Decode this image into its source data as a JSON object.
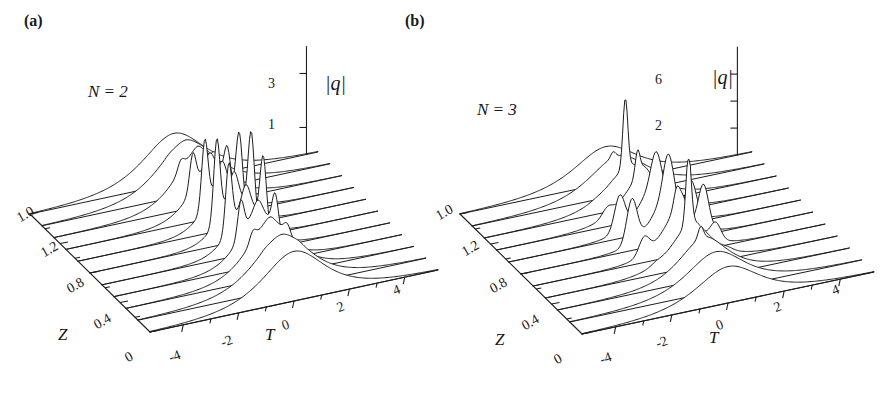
{
  "figure": {
    "background_color": "#ffffff",
    "line_color": "#1d1d1d",
    "panels": [
      {
        "tag": "(a)",
        "condition_label": "N = 2",
        "vertical_axis": {
          "label": "|q|",
          "label_symbol": "q",
          "tick_labels": [
            "3",
            "1"
          ],
          "tick_values": [
            3,
            1
          ],
          "range": [
            0,
            4
          ]
        },
        "t_axis": {
          "label": "T",
          "tick_labels": [
            "-4",
            "-2",
            "0",
            "2",
            "4"
          ]
        },
        "z_axis": {
          "label": "Z",
          "tick_labels": [
            "0",
            "0.4",
            "0.8",
            "1.2",
            "1.0"
          ]
        }
      },
      {
        "tag": "(b)",
        "condition_label": "N = 3",
        "vertical_axis": {
          "label": "|q|",
          "label_symbol": "q",
          "tick_labels": [
            "6",
            "2"
          ],
          "tick_values": [
            6,
            2
          ],
          "range": [
            0,
            8
          ]
        },
        "t_axis": {
          "label": "T",
          "tick_labels": [
            "-4",
            "-2",
            "0",
            "2",
            "4"
          ]
        },
        "z_axis": {
          "label": "Z",
          "tick_labels": [
            "0",
            "0.4",
            "0.8",
            "1.2",
            "1.0"
          ]
        }
      }
    ]
  },
  "chart_data": [
    {
      "type": "line",
      "title": "(a) N = 2 higher-order soliton evolution",
      "plot_style": "3d-waterfall",
      "xlabel": "T",
      "ylabel": "Z",
      "zlabel": "|q|",
      "xlim": [
        -5,
        5
      ],
      "ylim": [
        0,
        1.6
      ],
      "zlim": [
        0,
        4
      ],
      "xticks": [
        -4,
        -2,
        0,
        2,
        4
      ],
      "yticks": [
        0,
        0.4,
        0.8,
        1.2,
        1.6
      ],
      "zticks": [
        1,
        3
      ],
      "grid": false,
      "legend": "none",
      "annotations": [
        "N = 2"
      ],
      "series": [
        {
          "name": "Z = 0.00",
          "z": 0.0,
          "peak_amplitude": 2.0,
          "peak_count": 1,
          "peak_T": [
            0.0
          ],
          "description": "single broad sech pulse"
        },
        {
          "name": "Z = 0.16",
          "z": 0.16,
          "peak_amplitude": 2.1,
          "peak_count": 1,
          "peak_T": [
            0.0
          ],
          "description": "pulse narrowing begins"
        },
        {
          "name": "Z = 0.32",
          "z": 0.32,
          "peak_amplitude": 2.4,
          "peak_count": 1,
          "peak_T": [
            0.0
          ],
          "description": "compressing"
        },
        {
          "name": "Z = 0.48",
          "z": 0.48,
          "peak_amplitude": 2.9,
          "peak_count": 1,
          "peak_T": [
            0.0
          ],
          "description": "strong compression"
        },
        {
          "name": "Z = 0.64",
          "z": 0.64,
          "peak_amplitude": 3.5,
          "peak_count": 2,
          "peak_T": [
            -0.5,
            0.5
          ],
          "description": "splitting into two peaks"
        },
        {
          "name": "Z = 0.80",
          "z": 0.8,
          "peak_amplitude": 3.9,
          "peak_count": 2,
          "peak_T": [
            -0.7,
            0.7
          ],
          "description": "maximum compression, twin spikes"
        },
        {
          "name": "Z = 0.96",
          "z": 0.96,
          "peak_amplitude": 3.6,
          "peak_count": 2,
          "peak_T": [
            -0.6,
            0.6
          ],
          "description": "recombination starts"
        },
        {
          "name": "Z = 1.12",
          "z": 1.12,
          "peak_amplitude": 3.0,
          "peak_count": 1,
          "peak_T": [
            0.0
          ],
          "description": "merging back"
        },
        {
          "name": "Z = 1.28",
          "z": 1.28,
          "peak_amplitude": 2.4,
          "peak_count": 1,
          "peak_T": [
            0.0
          ],
          "description": "broadening"
        },
        {
          "name": "Z = 1.44",
          "z": 1.44,
          "peak_amplitude": 2.1,
          "peak_count": 1,
          "peak_T": [
            0.0
          ],
          "description": "near recurrence"
        },
        {
          "name": "Z = 1.60",
          "z": 1.6,
          "peak_amplitude": 2.0,
          "peak_count": 1,
          "peak_T": [
            0.0
          ],
          "description": "full periodic recurrence"
        }
      ]
    },
    {
      "type": "line",
      "title": "(b) N = 3 higher-order soliton evolution",
      "plot_style": "3d-waterfall",
      "xlabel": "T",
      "ylabel": "Z",
      "zlabel": "|q|",
      "xlim": [
        -5,
        5
      ],
      "ylim": [
        0,
        1.6
      ],
      "zlim": [
        0,
        8
      ],
      "xticks": [
        -4,
        -2,
        0,
        2,
        4
      ],
      "yticks": [
        0,
        0.4,
        0.8,
        1.2,
        1.6
      ],
      "zticks": [
        2,
        4,
        6
      ],
      "grid": false,
      "legend": "none",
      "annotations": [
        "N = 3"
      ],
      "series": [
        {
          "name": "Z = 0.00",
          "z": 0.0,
          "peak_amplitude": 3.0,
          "peak_count": 1,
          "peak_T": [
            0.0
          ],
          "description": "single broad sech pulse"
        },
        {
          "name": "Z = 0.16",
          "z": 0.16,
          "peak_amplitude": 3.4,
          "peak_count": 1,
          "peak_T": [
            0.0
          ],
          "description": "narrowing"
        },
        {
          "name": "Z = 0.32",
          "z": 0.32,
          "peak_amplitude": 4.4,
          "peak_count": 1,
          "peak_T": [
            0.0
          ],
          "description": "sharp compression"
        },
        {
          "name": "Z = 0.48",
          "z": 0.48,
          "peak_amplitude": 6.3,
          "peak_count": 1,
          "peak_T": [
            0.0
          ],
          "description": "very tall narrow spike"
        },
        {
          "name": "Z = 0.64",
          "z": 0.64,
          "peak_amplitude": 5.5,
          "peak_count": 2,
          "peak_T": [
            -0.8,
            0.6
          ],
          "description": "splitting"
        },
        {
          "name": "Z = 0.80",
          "z": 0.8,
          "peak_amplitude": 5.0,
          "peak_count": 3,
          "peak_T": [
            -1.2,
            0.0,
            1.2
          ],
          "description": "three-peak structure"
        },
        {
          "name": "Z = 0.96",
          "z": 0.96,
          "peak_amplitude": 4.6,
          "peak_count": 3,
          "peak_T": [
            -1.3,
            0.0,
            1.3
          ],
          "description": "three peaks persisting"
        },
        {
          "name": "Z = 1.12",
          "z": 1.12,
          "peak_amplitude": 5.8,
          "peak_count": 2,
          "peak_T": [
            -0.8,
            0.7
          ],
          "description": "recompression"
        },
        {
          "name": "Z = 1.28",
          "z": 1.28,
          "peak_amplitude": 6.6,
          "peak_count": 1,
          "peak_T": [
            -0.1
          ],
          "description": "second tall spike"
        },
        {
          "name": "Z = 1.44",
          "z": 1.44,
          "peak_amplitude": 4.0,
          "peak_count": 1,
          "peak_T": [
            0.0
          ],
          "description": "broadening"
        },
        {
          "name": "Z = 1.60",
          "z": 1.6,
          "peak_amplitude": 3.0,
          "peak_count": 1,
          "peak_T": [
            0.0
          ],
          "description": "periodic recurrence"
        }
      ]
    }
  ]
}
